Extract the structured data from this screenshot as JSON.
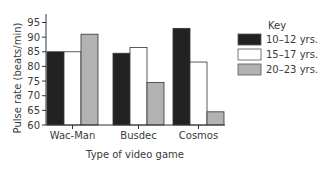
{
  "chart_data": {
    "type": "bar",
    "title": "",
    "xlabel": "Type of video game",
    "ylabel": "Pulse rate (beats/min)",
    "ylim": [
      60,
      95
    ],
    "yticks": [
      60,
      65,
      70,
      75,
      80,
      85,
      90,
      95
    ],
    "grid": false,
    "legend_title": "Key",
    "legend_position": "right",
    "categories": [
      "Wac-Man",
      "Busdec",
      "Cosmos"
    ],
    "series": [
      {
        "name": "10–12 yrs.",
        "color": "#222222",
        "values": [
          85,
          84.5,
          93
        ]
      },
      {
        "name": "15–17 yrs.",
        "color": "#ffffff",
        "values": [
          85,
          86.5,
          81.5
        ]
      },
      {
        "name": "20–23 yrs.",
        "color": "#b3b3b3",
        "values": [
          91,
          74.5,
          64.5
        ]
      }
    ]
  }
}
